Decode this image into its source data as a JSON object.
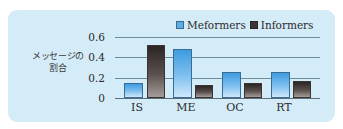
{
  "chart_data": {
    "type": "bar",
    "title": "",
    "xlabel": "",
    "ylabel": "メッセージの割合",
    "categories": [
      "IS",
      "ME",
      "OC",
      "RT"
    ],
    "series": [
      {
        "name": "Meformers",
        "values": [
          0.15,
          0.48,
          0.26,
          0.26
        ],
        "color": "#4aa6e6"
      },
      {
        "name": "Informers",
        "values": [
          0.52,
          0.13,
          0.15,
          0.17
        ],
        "color": "#3e3634"
      }
    ],
    "ylim": [
      0,
      0.6
    ],
    "yticks": [
      "0",
      "0.2",
      "0.4",
      "0.6"
    ],
    "grid": true,
    "legend_position": "top-right"
  },
  "labels": {
    "ylabel_line1": "メッセージの",
    "ylabel_line2": "割合",
    "legend_mef": "Meformers",
    "legend_inf": "Informers",
    "tick0": "0",
    "tick1": "0.2",
    "tick2": "0.4",
    "tick3": "0.6",
    "cat0": "IS",
    "cat1": "ME",
    "cat2": "OC",
    "cat3": "RT"
  }
}
